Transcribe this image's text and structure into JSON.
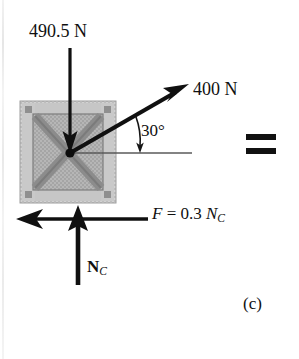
{
  "figure": {
    "part_label": "(c)",
    "equals_symbol": "=",
    "caption_kind": "free-body-diagram"
  },
  "forces": {
    "weight": {
      "label": "490.5 N",
      "direction": "down",
      "magnitude": 490.5,
      "unit": "N"
    },
    "applied": {
      "label": "400 N",
      "direction": "up-right",
      "magnitude": 400,
      "unit": "N",
      "angle_label": "30°",
      "angle_degrees": 30
    },
    "friction": {
      "label_parts": {
        "symbol": "F",
        "equals": " = ",
        "coefficient": "0.3 ",
        "normal_symbol": "N",
        "normal_subscript": "C"
      },
      "direction": "left"
    },
    "normal": {
      "label_parts": {
        "symbol": "N",
        "subscript": "C"
      },
      "direction": "up"
    }
  },
  "body": {
    "name": "crate",
    "shape": "square",
    "bracing": "x-brace"
  },
  "colors": {
    "ink": "#101010",
    "crate_frame": "#b9b9b9",
    "crate_panel": "#a8a8a8",
    "crate_brace": "#9a9a9a",
    "crate_light": "#cfcfcf",
    "reference_line": "#4a4a4a",
    "page_background": "#ffffff"
  }
}
